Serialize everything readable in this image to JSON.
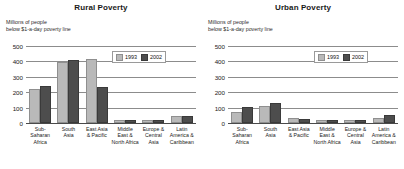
{
  "panels": [
    {
      "title": "Rural Poverty",
      "subtitle": "Millions of people\nbelow $1-a-day poverty line",
      "legend": {
        "a": "1993",
        "b": "2002"
      }
    },
    {
      "title": "Urban Poverty",
      "subtitle": "Millions of people\nbelow $1-a-day poverty line",
      "legend": {
        "a": "1993",
        "b": "2002"
      }
    }
  ],
  "axis": {
    "ticks": [
      "500",
      "400",
      "300",
      "200",
      "100",
      "0"
    ]
  },
  "categories_display": [
    "Sub-\nSaharan\nAfrica",
    "South\nAsia",
    "East Asia\n& Pacific",
    "Middle\nEast &\nNorth Africa",
    "Europe &\nCentral\nAsia",
    "Latin\nAmerica &\nCaribbean"
  ],
  "colors": {
    "series_1993": "#b9b9b9",
    "series_2002": "#4d4d4d",
    "gridline": "#8c8c8c",
    "axis": "#4a4a4a",
    "text": "#1a1a1a",
    "background": "#ffffff"
  },
  "chart_data": [
    {
      "type": "bar",
      "title": "Rural Poverty",
      "subtitle": "Millions of people below $1-a-day poverty line",
      "xlabel": "",
      "ylabel": "Millions of people below $1-a-day poverty line",
      "ylim": [
        0,
        500
      ],
      "yticks": [
        0,
        100,
        200,
        300,
        400,
        500
      ],
      "grid": true,
      "legend_position": "top-right inside",
      "categories": [
        "Sub-Saharan Africa",
        "South Asia",
        "East Asia & Pacific",
        "Middle East & North Africa",
        "Europe & Central Asia",
        "Latin America & Caribbean"
      ],
      "series": [
        {
          "name": "1993",
          "values": [
            205,
            380,
            400,
            5,
            4,
            30
          ]
        },
        {
          "name": "2002",
          "values": [
            225,
            395,
            220,
            6,
            5,
            32
          ]
        }
      ]
    },
    {
      "type": "bar",
      "title": "Urban Poverty",
      "subtitle": "Millions of people below $1-a-day poverty line",
      "xlabel": "",
      "ylabel": "Millions of people below $1-a-day poverty line",
      "ylim": [
        0,
        500
      ],
      "yticks": [
        0,
        100,
        200,
        300,
        400,
        500
      ],
      "grid": true,
      "legend_position": "top-right inside",
      "categories": [
        "Sub-Saharan Africa",
        "South Asia",
        "East Asia & Pacific",
        "Middle East & North Africa",
        "Europe & Central Asia",
        "Latin America & Caribbean"
      ],
      "series": [
        {
          "name": "1993",
          "values": [
            60,
            95,
            20,
            4,
            5,
            22
          ]
        },
        {
          "name": "2002",
          "values": [
            90,
            118,
            10,
            5,
            6,
            38
          ]
        }
      ]
    }
  ]
}
